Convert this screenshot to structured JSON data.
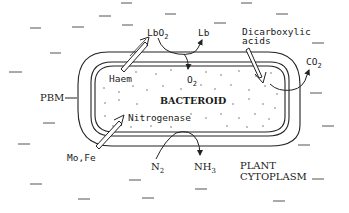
{
  "diagram": {
    "type": "biological-schematic",
    "regions": {
      "bacteroid": {
        "label": "BACTEROID"
      },
      "plant_cytoplasm": {
        "label_line1": "PLANT",
        "label_line2": "CYTOPLASM"
      },
      "membrane": {
        "label": "PBM"
      }
    },
    "labels": {
      "lbo2": {
        "main": "LbO",
        "sub": "2"
      },
      "lb": {
        "main": "Lb"
      },
      "dicarboxylic_line1": "Dicarboxylic",
      "dicarboxylic_line2": "acids",
      "co2": {
        "main": "CO",
        "sub": "2"
      },
      "haem": "Haem",
      "o2": {
        "main": "O",
        "sub": "2"
      },
      "nitrogenase": "Nitrogenase",
      "mofe": "Mo,Fe",
      "n2": {
        "main": "N",
        "sub": "2"
      },
      "nh3": {
        "main": "NH",
        "sub": "3"
      }
    },
    "flows": [
      {
        "from": "Haem",
        "to": "LbO2",
        "style": "hollow-arrow"
      },
      {
        "from": "LbO2",
        "to": "O2 (into bacteroid) + Lb",
        "style": "curved-arrow"
      },
      {
        "from": "Dicarboxylic acids",
        "to": "bacteroid",
        "style": "hollow-arrow"
      },
      {
        "from": "bacteroid",
        "to": "CO2",
        "style": "curved-arrow"
      },
      {
        "from": "Mo,Fe",
        "to": "Nitrogenase",
        "style": "hollow-arrow"
      },
      {
        "from": "N2",
        "to": "NH3",
        "style": "curved-arrow"
      }
    ],
    "colors": {
      "ink": "#1a1a1a",
      "background": "#ffffff",
      "stipple": "#777777"
    }
  }
}
